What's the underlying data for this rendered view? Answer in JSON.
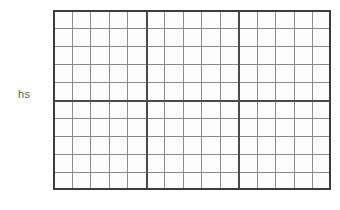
{
  "chart_data": {
    "type": "table",
    "title": "",
    "subtitle": "",
    "xlabel": "",
    "ylabel": "hs",
    "grid": true,
    "legend": [],
    "annotations": [],
    "series": [],
    "categories": [],
    "values": [],
    "tick_labels": {
      "x": [],
      "y": []
    },
    "xlim": [
      0,
      15
    ],
    "ylim": [
      0,
      10
    ],
    "grid_spec": {
      "columns": 15,
      "rows": 10,
      "major_column_lines": [
        5,
        10
      ],
      "major_row_lines": [
        5
      ],
      "minor_line_color": "#8a8a8a",
      "major_line_color": "#4a4a4a",
      "border_color": "#3d3d3d",
      "cell_fill": "#fdfdfd"
    }
  },
  "axis": {
    "y_label": "hs"
  },
  "canvas": {
    "background": "#ffffff",
    "plot_left": 53,
    "plot_top": 10,
    "plot_width": 278,
    "plot_height": 180
  }
}
